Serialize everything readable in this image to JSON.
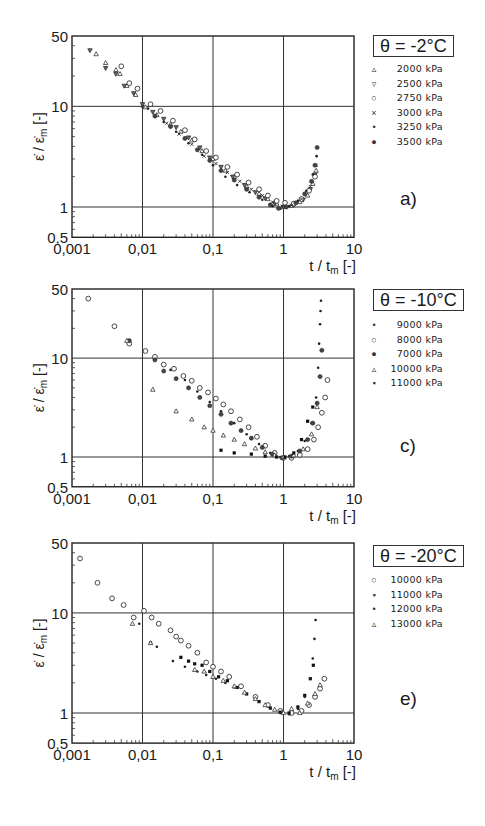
{
  "figure": {
    "y_label": "ε̇ / ε̇m [-]",
    "x_label": "t / tm [-]",
    "x_ticks": [
      "0,001",
      "0,01",
      "0,1",
      "1",
      "10"
    ],
    "y_ticks": [
      "0,5",
      "1",
      "10",
      "50"
    ]
  },
  "panels": [
    {
      "id": "a",
      "panel_label": "a)",
      "temperature_label": "θ = -2°C",
      "legend": [
        {
          "marker": "triangle-up",
          "glyph": "▵",
          "label": "2000 kPa"
        },
        {
          "marker": "triangle-down",
          "glyph": "▿",
          "label": "2500 kPa"
        },
        {
          "marker": "circle-open",
          "glyph": "○",
          "label": "2750 kPa"
        },
        {
          "marker": "cross-small",
          "glyph": "×",
          "label": "3000 kPa"
        },
        {
          "marker": "dot",
          "glyph": "•",
          "label": "3250 kPa"
        },
        {
          "marker": "circle-filled",
          "glyph": "●",
          "label": "3500 kPa"
        }
      ]
    },
    {
      "id": "c",
      "panel_label": "c)",
      "temperature_label": "θ = -10°C",
      "legend": [
        {
          "marker": "dot",
          "glyph": "•",
          "label": "9000 kPa"
        },
        {
          "marker": "circle-open",
          "glyph": "○",
          "label": "8000 kPa"
        },
        {
          "marker": "circle-filled",
          "glyph": "●",
          "label": "7000 kPa"
        },
        {
          "marker": "triangle-up",
          "glyph": "▵",
          "label": "10000 kPa"
        },
        {
          "marker": "square-filled",
          "glyph": "▪",
          "label": "11000 kPa"
        }
      ]
    },
    {
      "id": "e",
      "panel_label": "e)",
      "temperature_label": "θ = -20°C",
      "legend": [
        {
          "marker": "circle-open",
          "glyph": "○",
          "label": "10000 kPa"
        },
        {
          "marker": "square-filled",
          "glyph": "▪",
          "label": "11000 kPa"
        },
        {
          "marker": "dot",
          "glyph": "•",
          "label": "12000 kPa"
        },
        {
          "marker": "triangle-up",
          "glyph": "▵",
          "label": "13000 kPa"
        }
      ]
    }
  ],
  "chart_data": [
    {
      "type": "scatter",
      "title": "θ = -2°C",
      "panel": "a)",
      "xlabel": "t / tm [-]",
      "ylabel": "ε̇ / ε̇m [-]",
      "xscale": "log",
      "yscale": "log",
      "xlim": [
        0.001,
        10
      ],
      "ylim": [
        0.5,
        50
      ],
      "xticks": [
        0.001,
        0.01,
        0.1,
        1,
        10
      ],
      "yticks": [
        0.5,
        1,
        10,
        50
      ],
      "grid": true,
      "legend_position": "right",
      "series": [
        {
          "name": "2000 kPa",
          "marker": "triangle-up",
          "x": [
            0.0022,
            0.003,
            0.0042,
            0.0048,
            0.006,
            0.008,
            0.011,
            0.016,
            0.025,
            0.035,
            0.05,
            0.07,
            0.1,
            0.15,
            0.2,
            0.3,
            0.45,
            0.6,
            0.8,
            1.0,
            1.3,
            1.7,
            2.2,
            2.6,
            2.9
          ],
          "y": [
            33,
            27,
            23,
            21,
            16,
            13,
            9.8,
            8.2,
            6.6,
            5.6,
            4.6,
            3.6,
            3.0,
            2.3,
            2.0,
            1.6,
            1.35,
            1.2,
            1.08,
            1.0,
            1.03,
            1.12,
            1.3,
            1.7,
            2.3
          ]
        },
        {
          "name": "2500 kPa",
          "marker": "triangle-down",
          "x": [
            0.0018,
            0.003,
            0.0042,
            0.0055,
            0.0075,
            0.01,
            0.014,
            0.02,
            0.03,
            0.045,
            0.065,
            0.09,
            0.13,
            0.19,
            0.28,
            0.4,
            0.55,
            0.75,
            1.0,
            1.4,
            1.9,
            2.4,
            2.8
          ],
          "y": [
            36,
            24,
            21,
            16,
            13.5,
            10.5,
            8.8,
            7.5,
            6.2,
            4.9,
            3.9,
            3.1,
            2.5,
            2.0,
            1.65,
            1.4,
            1.22,
            1.08,
            1.0,
            1.05,
            1.18,
            1.5,
            2.1
          ]
        },
        {
          "name": "2750 kPa",
          "marker": "circle-open",
          "x": [
            0.005,
            0.0065,
            0.0085,
            0.013,
            0.018,
            0.027,
            0.04,
            0.055,
            0.08,
            0.11,
            0.16,
            0.22,
            0.32,
            0.45,
            0.6,
            0.8,
            1.05,
            1.4,
            1.8,
            2.3,
            2.8
          ],
          "y": [
            25,
            17,
            15,
            10.5,
            9.0,
            7.2,
            5.8,
            4.7,
            3.6,
            3.1,
            2.5,
            2.1,
            1.75,
            1.5,
            1.3,
            1.15,
            1.1,
            1.08,
            1.2,
            1.45,
            2.0
          ]
        },
        {
          "name": "3000 kPa",
          "marker": "cross-small",
          "x": [
            0.01,
            0.015,
            0.022,
            0.033,
            0.05,
            0.075,
            0.11,
            0.16,
            0.24,
            0.35,
            0.5,
            0.7,
            0.95,
            1.3,
            1.8,
            2.4,
            2.9
          ],
          "y": [
            10,
            8.2,
            6.8,
            5.3,
            4.2,
            3.2,
            2.7,
            2.2,
            1.8,
            1.5,
            1.3,
            1.12,
            1.02,
            1.04,
            1.2,
            1.6,
            2.6
          ]
        },
        {
          "name": "3250 kPa",
          "marker": "dot",
          "x": [
            0.012,
            0.02,
            0.03,
            0.045,
            0.07,
            0.1,
            0.15,
            0.22,
            0.33,
            0.5,
            0.7,
            0.9,
            1.2,
            1.6,
            2.1,
            2.6,
            2.95
          ],
          "y": [
            9.5,
            7.0,
            5.6,
            4.3,
            3.3,
            2.6,
            2.0,
            1.65,
            1.4,
            1.18,
            1.02,
            0.96,
            1.02,
            1.15,
            1.45,
            2.1,
            3.2
          ]
        },
        {
          "name": "3500 kPa",
          "marker": "circle-filled",
          "x": [
            0.015,
            0.025,
            0.04,
            0.06,
            0.09,
            0.13,
            0.2,
            0.3,
            0.45,
            0.65,
            0.85,
            1.1,
            1.5,
            2.0,
            2.5,
            2.8,
            3.0
          ],
          "y": [
            8.0,
            6.3,
            4.8,
            3.7,
            2.9,
            2.3,
            1.85,
            1.5,
            1.25,
            1.05,
            0.97,
            1.0,
            1.1,
            1.35,
            1.8,
            2.6,
            3.9
          ]
        }
      ]
    },
    {
      "type": "scatter",
      "title": "θ = -10°C",
      "panel": "c)",
      "xlabel": "t / tm [-]",
      "ylabel": "ε̇ / ε̇m [-]",
      "xscale": "log",
      "yscale": "log",
      "xlim": [
        0.001,
        10
      ],
      "ylim": [
        0.5,
        50
      ],
      "xticks": [
        0.001,
        0.01,
        0.1,
        1,
        10
      ],
      "yticks": [
        0.5,
        1,
        10,
        50
      ],
      "grid": true,
      "legend_position": "right",
      "series": [
        {
          "name": "9000 kPa",
          "marker": "dot",
          "x": [
            0.015,
            0.025,
            0.04,
            0.06,
            0.09,
            0.13,
            0.2,
            0.3,
            0.45,
            0.65,
            0.9,
            1.2,
            1.6,
            2.0,
            2.5,
            2.9,
            3.1,
            3.2,
            3.3,
            3.35,
            3.4
          ],
          "y": [
            9.5,
            7.6,
            6.0,
            4.6,
            3.6,
            2.9,
            2.2,
            1.7,
            1.35,
            1.1,
            1.0,
            1.02,
            1.15,
            1.45,
            2.2,
            4.0,
            8.0,
            14,
            22,
            30,
            38
          ]
        },
        {
          "name": "8000 kPa",
          "marker": "circle-open",
          "x": [
            0.0017,
            0.004,
            0.0065,
            0.011,
            0.015,
            0.02,
            0.028,
            0.038,
            0.05,
            0.065,
            0.085,
            0.11,
            0.14,
            0.18,
            0.24,
            0.32,
            0.42,
            0.55,
            0.75,
            1.0,
            1.3,
            1.7,
            2.2,
            2.7,
            3.1,
            3.5,
            3.9,
            4.2
          ],
          "y": [
            40,
            21,
            14,
            11.8,
            10.3,
            8.6,
            7.8,
            6.6,
            5.9,
            5.0,
            4.5,
            3.9,
            3.4,
            2.9,
            2.4,
            2.0,
            1.6,
            1.3,
            1.1,
            0.98,
            0.98,
            1.05,
            1.2,
            1.5,
            2.0,
            2.8,
            4.0,
            6.0
          ]
        },
        {
          "name": "7000 kPa",
          "marker": "circle-filled",
          "x": [
            0.0065,
            0.015,
            0.02,
            0.03,
            0.045,
            0.065,
            0.09,
            0.13,
            0.18,
            0.25,
            0.35,
            0.5,
            0.7,
            0.95,
            1.3,
            1.7,
            2.2,
            2.6,
            3.0,
            3.3,
            3.5
          ],
          "y": [
            15,
            9.6,
            7.4,
            6.2,
            5.0,
            4.0,
            3.3,
            2.7,
            2.2,
            1.85,
            1.55,
            1.25,
            1.06,
            0.98,
            1.02,
            1.15,
            1.5,
            2.2,
            3.5,
            6.5,
            12
          ]
        },
        {
          "name": "10000 kPa",
          "marker": "triangle-up",
          "x": [
            0.006,
            0.014,
            0.03,
            0.05,
            0.075,
            0.1,
            0.14,
            0.2,
            0.28,
            0.4,
            0.55,
            0.75,
            1.0,
            1.4,
            1.9,
            2.5,
            3.0
          ],
          "y": [
            15,
            4.8,
            2.9,
            2.4,
            2.0,
            1.85,
            1.65,
            1.5,
            1.35,
            1.22,
            1.12,
            1.04,
            1.0,
            1.04,
            1.2,
            1.7,
            3.2
          ]
        },
        {
          "name": "11000 kPa",
          "marker": "square-filled",
          "x": [
            0.13,
            0.2,
            0.35,
            0.55,
            0.8,
            1.05,
            1.4,
            1.8,
            2.2,
            2.6
          ],
          "y": [
            1.17,
            1.1,
            1.07,
            1.02,
            1.0,
            1.0,
            1.1,
            1.5,
            2.3,
            3.2
          ]
        }
      ]
    },
    {
      "type": "scatter",
      "title": "θ = -20°C",
      "panel": "e)",
      "xlabel": "t / tm [-]",
      "ylabel": "ε̇ / ε̇m [-]",
      "xscale": "log",
      "yscale": "log",
      "xlim": [
        0.001,
        10
      ],
      "ylim": [
        0.5,
        50
      ],
      "xticks": [
        0.001,
        0.01,
        0.1,
        1,
        10
      ],
      "yticks": [
        0.5,
        1,
        10,
        50
      ],
      "grid": true,
      "legend_position": "right",
      "series": [
        {
          "name": "10000 kPa",
          "marker": "circle-open",
          "x": [
            0.0013,
            0.0023,
            0.0037,
            0.0054,
            0.0075,
            0.0105,
            0.0135,
            0.017,
            0.025,
            0.03,
            0.035,
            0.045,
            0.06,
            0.08,
            0.1,
            0.13,
            0.17,
            0.25,
            0.4,
            0.6,
            0.9,
            1.3,
            1.8,
            2.3,
            2.8,
            3.3,
            3.8
          ],
          "y": [
            35,
            20,
            14,
            12,
            9.0,
            10.5,
            9.0,
            7.8,
            6.7,
            5.8,
            5.3,
            4.7,
            4.0,
            3.2,
            2.9,
            2.6,
            2.3,
            1.85,
            1.45,
            1.2,
            1.05,
            1.0,
            1.05,
            1.2,
            1.45,
            1.75,
            2.2
          ]
        },
        {
          "name": "11000 kPa",
          "marker": "square-filled",
          "x": [
            0.013,
            0.035,
            0.045,
            0.055,
            0.07,
            0.09,
            0.12,
            0.16,
            0.22,
            0.3,
            0.45,
            0.65,
            0.9,
            1.2,
            1.6,
            2.0,
            2.4,
            2.65
          ],
          "y": [
            5.0,
            3.6,
            3.3,
            3.1,
            3.0,
            2.6,
            2.3,
            2.1,
            1.8,
            1.55,
            1.3,
            1.12,
            1.02,
            1.0,
            1.15,
            1.5,
            2.2,
            3.0
          ]
        },
        {
          "name": "12000 kPa",
          "marker": "dot",
          "x": [
            0.009,
            0.016,
            0.027,
            0.04,
            0.06,
            0.08,
            0.11,
            0.15,
            0.2,
            0.3,
            0.45,
            0.65,
            0.9,
            1.2,
            1.6,
            2.0,
            2.4,
            2.6,
            2.75,
            2.85
          ],
          "y": [
            7.8,
            4.6,
            3.3,
            2.9,
            2.6,
            2.4,
            2.2,
            2.0,
            1.8,
            1.55,
            1.3,
            1.12,
            1.0,
            0.97,
            1.1,
            1.45,
            2.2,
            3.5,
            5.5,
            8.5
          ]
        },
        {
          "name": "13000 kPa",
          "marker": "triangle-up",
          "x": [
            0.0072,
            0.013,
            0.055,
            0.075,
            0.1,
            0.14,
            0.2,
            0.28,
            0.4,
            0.55,
            0.75,
            1.0,
            1.3,
            1.7,
            2.2,
            2.8,
            3.3
          ],
          "y": [
            7.8,
            5.0,
            2.7,
            2.6,
            2.3,
            2.1,
            1.85,
            1.6,
            1.38,
            1.2,
            1.08,
            1.0,
            1.1,
            1.0,
            1.25,
            1.55,
            1.9
          ]
        }
      ]
    }
  ]
}
